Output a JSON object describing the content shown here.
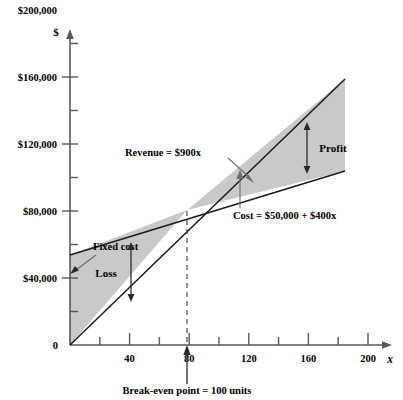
{
  "chart_data": {
    "type": "line",
    "title": "",
    "xlabel": "x",
    "ylabel": "$",
    "xlim": [
      0,
      234
    ],
    "ylim": [
      0,
      220000
    ],
    "grid": false,
    "legend_position": "inline-annotations",
    "x_ticks_major": [
      40,
      80,
      120,
      160,
      200
    ],
    "x_tick_labels": [
      "40",
      "80",
      "120",
      "160",
      "200"
    ],
    "x_ticks_minor": [
      20,
      60,
      100,
      140,
      180,
      220
    ],
    "y_ticks_major": [
      40000,
      80000,
      120000,
      160000,
      200000
    ],
    "y_tick_labels": [
      "$40,000",
      "$80,000",
      "$120,000",
      "$160,000",
      "$200,000"
    ],
    "y_ticks_minor": [
      20000,
      60000,
      100000,
      140000,
      180000
    ],
    "origin_label": "0",
    "series": [
      {
        "name": "Revenue",
        "equation_label": "Revenue = $900x",
        "slope": 900,
        "intercept": 0,
        "points": [
          [
            0,
            0
          ],
          [
            230,
            207000
          ]
        ]
      },
      {
        "name": "Cost",
        "equation_label": "Cost = $50,000 + $400x",
        "slope": 400,
        "intercept": 50000,
        "points": [
          [
            0,
            50000
          ],
          [
            230,
            142000
          ]
        ]
      }
    ],
    "annotations": [
      {
        "name": "fixed-cost",
        "text": "Fixed cost",
        "value": 50000,
        "points_to": [
          0,
          50000
        ]
      },
      {
        "name": "loss-region",
        "text": "Loss",
        "x_range": [
          0,
          100
        ]
      },
      {
        "name": "profit-region",
        "text": "Profit",
        "x_range": [
          100,
          230
        ]
      },
      {
        "name": "break-even",
        "text": "Break-even point = 100 units",
        "x": 100,
        "y": 90000
      }
    ]
  },
  "labels": {
    "y_axis_title": "$",
    "x_axis_title": "x",
    "origin": "0",
    "y_tick_200k": "$200,000",
    "y_tick_160k": "$160,000",
    "y_tick_120k": "$120,000",
    "y_tick_80k": "$80,000",
    "y_tick_40k": "$40,000",
    "x_tick_40": "40",
    "x_tick_80": "80",
    "x_tick_120": "120",
    "x_tick_160": "160",
    "x_tick_200": "200",
    "revenue_equation": "Revenue = $900x",
    "cost_equation": "Cost = $50,000 + $400x",
    "fixed_cost": "Fixed cost",
    "loss": "Loss",
    "profit": "Profit",
    "break_even": "Break-even point = 100 units"
  },
  "colors": {
    "shaded_region": "#c9c9c9",
    "axis": "#58585a",
    "line": "#1b1b1b",
    "background": "#ffffff"
  }
}
